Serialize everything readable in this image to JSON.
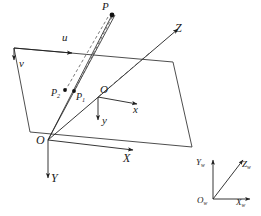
{
  "figure": {
    "type": "camera-projection-geometry-diagram",
    "background_color": "#ffffff",
    "stroke_color": "#2a2a2a",
    "title": ""
  },
  "image_plane": {
    "name": "image-plane-parallelogram",
    "corners": [
      [
        14,
        48
      ],
      [
        173,
        62
      ],
      [
        192,
        147
      ],
      [
        30,
        132
      ]
    ]
  },
  "pixel_axes": {
    "u": {
      "label": "u",
      "direction": "right",
      "origin": [
        14,
        48
      ]
    },
    "v": {
      "label": "v",
      "direction": "down",
      "origin": [
        14,
        48
      ]
    }
  },
  "image_axes": {
    "origin_label": "O",
    "x": {
      "label": "x",
      "direction": "right"
    },
    "y": {
      "label": "y",
      "direction": "down"
    }
  },
  "camera_axes": {
    "origin_label": "O",
    "x_label": "X",
    "y_label": "Y",
    "z_label": "Z"
  },
  "points": [
    {
      "label": "P",
      "sub": "",
      "x": 112,
      "y": 14,
      "label_x": 103,
      "label_y": 4
    },
    {
      "label": "P",
      "sub": "1",
      "x": 74,
      "y": 92,
      "label_x": 76,
      "label_y": 94
    },
    {
      "label": "P",
      "sub": "2",
      "x": 65,
      "y": 91,
      "label_x": 54,
      "label_y": 89
    }
  ],
  "world_axes": {
    "origin_label": "O",
    "origin_sub": "w",
    "x_label": "X",
    "x_sub": "w",
    "y_label": "Y",
    "y_sub": "w",
    "z_label": "Z",
    "z_sub": "w"
  },
  "labels": {
    "u": "u",
    "v": "v",
    "x_small": "x",
    "y_small": "y",
    "o_small": "O",
    "o_big": "O",
    "X_big": "X",
    "Y_big": "Y",
    "Z_big": "Z",
    "P": "P",
    "P1_base": "P",
    "P1_sub": "1",
    "P2_base": "P",
    "P2_sub": "2",
    "Ow_base": "O",
    "Ow_sub": "w",
    "Xw_base": "X",
    "Xw_sub": "w",
    "Yw_base": "Y",
    "Yw_sub": "w",
    "Zw_base": "Z",
    "Zw_sub": "w"
  }
}
